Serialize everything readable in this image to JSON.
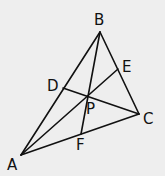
{
  "diagram": {
    "type": "triangle-cevians",
    "background": "#eeeeee",
    "stroke_color": "#111111",
    "points": {
      "A": {
        "x": 21,
        "y": 155
      },
      "B": {
        "x": 100,
        "y": 32
      },
      "C": {
        "x": 139,
        "y": 114
      },
      "D": {
        "x": 63,
        "y": 88
      },
      "E": {
        "x": 118,
        "y": 69
      },
      "F": {
        "x": 81,
        "y": 134
      },
      "P": {
        "x": 88,
        "y": 96
      }
    },
    "labels": {
      "A": {
        "text": "A",
        "x": 7,
        "y": 170
      },
      "B": {
        "text": "B",
        "x": 94,
        "y": 25
      },
      "C": {
        "text": "C",
        "x": 143,
        "y": 124
      },
      "D": {
        "text": "D",
        "x": 47,
        "y": 91
      },
      "E": {
        "text": "E",
        "x": 122,
        "y": 72
      },
      "F": {
        "text": "F",
        "x": 76,
        "y": 150
      },
      "P": {
        "text": "P",
        "x": 86,
        "y": 114
      }
    },
    "segments": [
      {
        "name": "side-AB",
        "from": "A",
        "to": "B"
      },
      {
        "name": "side-BC",
        "from": "B",
        "to": "C"
      },
      {
        "name": "side-CA",
        "from": "C",
        "to": "A"
      },
      {
        "name": "cevian-AE",
        "from": "A",
        "to": "E"
      },
      {
        "name": "cevian-BF",
        "from": "B",
        "to": "F"
      },
      {
        "name": "cevian-CD",
        "from": "C",
        "to": "D"
      }
    ]
  }
}
